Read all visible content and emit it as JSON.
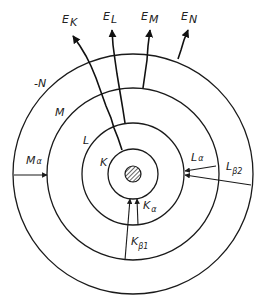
{
  "diagram": {
    "type": "atomic-shell-xray-emission",
    "center": [
      133,
      174
    ],
    "shells": [
      {
        "id": "K",
        "label": "K",
        "radius": 25
      },
      {
        "id": "L",
        "label": "L",
        "radius": 51
      },
      {
        "id": "M",
        "label": "M",
        "radius": 86
      },
      {
        "id": "N",
        "label": "-N",
        "radius": 120
      }
    ],
    "nucleus": {
      "radius": 8,
      "pattern": "hatched"
    },
    "emitted_electrons": [
      {
        "label_main": "E",
        "label_sub": "K"
      },
      {
        "label_main": "E",
        "label_sub": "L"
      },
      {
        "label_main": "E",
        "label_sub": "M"
      },
      {
        "label_main": "E",
        "label_sub": "N"
      }
    ],
    "transitions": [
      {
        "label_main": "M",
        "label_sub": "α",
        "from": "N",
        "to": "M"
      },
      {
        "label_main": "L",
        "label_sub": "α",
        "from": "M",
        "to": "L"
      },
      {
        "label_main": "L",
        "label_sub": "β2",
        "from": "N",
        "to": "L"
      },
      {
        "label_main": "K",
        "label_sub": "α",
        "from": "L",
        "to": "K"
      },
      {
        "label_main": "K",
        "label_sub": "β1",
        "from": "M",
        "to": "K"
      }
    ],
    "colors": {
      "line": "#1a1a1a",
      "background": "#ffffff"
    }
  }
}
